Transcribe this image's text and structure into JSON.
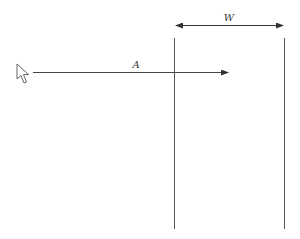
{
  "diagram": {
    "labels": {
      "width": "W",
      "arrow": "A"
    },
    "elements": {
      "cursor": "mouse-pointer-icon",
      "boundaries": [
        "left-boundary-line",
        "right-boundary-line"
      ],
      "dimension": "width-dimension-arrow",
      "motion": "horizontal-arrow-A"
    },
    "colors": {
      "line": "#333333",
      "background": "#ffffff"
    }
  }
}
